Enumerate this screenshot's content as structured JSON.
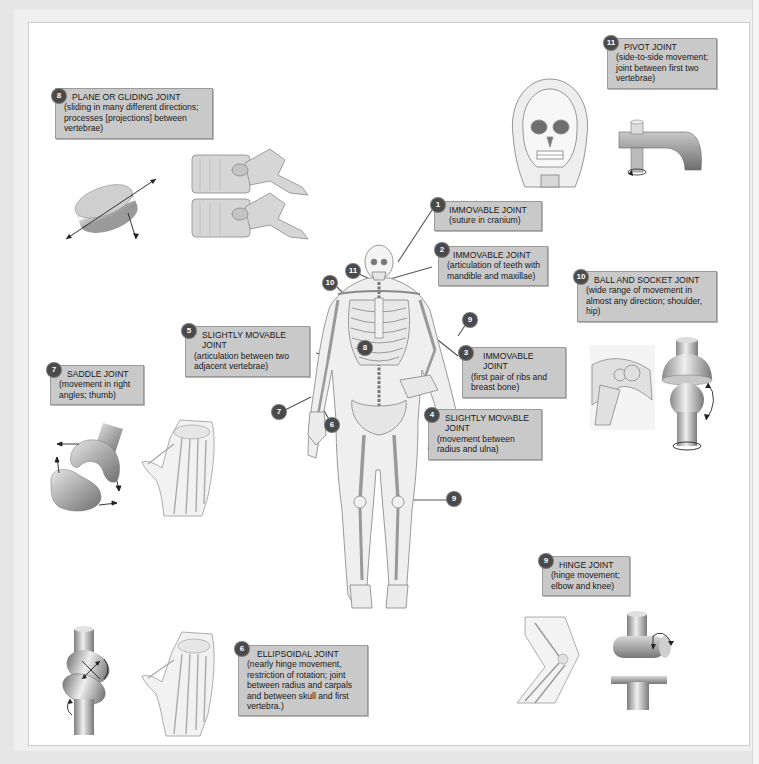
{
  "figure": {
    "colors": {
      "label_bg": "#c9c9c9",
      "label_border": "#9a9a9a",
      "badge_bg": "#4a4a4a",
      "badge_text": "#ffffff",
      "background": "#ffffff",
      "leader_line": "#555555"
    },
    "labels": [
      {
        "number": "1",
        "title": "IMMOVABLE JOINT",
        "description": "(suture in cranium)"
      },
      {
        "number": "2",
        "title": "IMMOVABLE JOINT",
        "description": "(articulation of teeth with mandible and maxillae)"
      },
      {
        "number": "3",
        "title": "IMMOVABLE JOINT",
        "description": "(first pair of ribs and breast bone)"
      },
      {
        "number": "4",
        "title": "SLIGHTLY MOVABLE JOINT",
        "description": "(movement between radius and ulna)"
      },
      {
        "number": "5",
        "title": "SLIGHTLY MOVABLE JOINT",
        "description": "(articulation between two adjacent vertebrae)"
      },
      {
        "number": "6",
        "title": "ELLIPSOIDAL JOINT",
        "description": "(nearly hinge movement, restriction of rotation; joint between radius and carpals and between skull and first vertebra.)"
      },
      {
        "number": "7",
        "title": "SADDLE JOINT",
        "description": "(movement in right angles;  thumb)"
      },
      {
        "number": "8",
        "title": "PLANE OR GLIDING JOINT",
        "description": "(sliding in many different directions;  processes [projections] between vertebrae)"
      },
      {
        "number": "9",
        "title": "HINGE JOINT",
        "description": "(hinge movement; elbow and knee)"
      },
      {
        "number": "10",
        "title": "BALL AND SOCKET JOINT",
        "description": "(wide range of movement in almost any direction; shoulder, hip)"
      },
      {
        "number": "11",
        "title": "PIVOT JOINT",
        "description": "(side-to-side movement; joint between first two vertebrae)"
      }
    ],
    "skeleton_markers": [
      {
        "number": "11",
        "location": "neck"
      },
      {
        "number": "10",
        "location": "shoulder"
      },
      {
        "number": "8",
        "location": "spine"
      },
      {
        "number": "9",
        "location": "elbow"
      },
      {
        "number": "7",
        "location": "thumb"
      },
      {
        "number": "6",
        "location": "wrist"
      },
      {
        "number": "9",
        "location": "knee"
      }
    ],
    "illustrations": [
      "plane-joint-model",
      "vertebrae-side-view",
      "skull-front-view",
      "pivot-joint-model",
      "shoulder-bones",
      "ball-socket-model",
      "saddle-joint-model",
      "hand-skeleton",
      "elbow-bones",
      "hinge-joint-model",
      "ellipsoidal-joint-model",
      "hand-wrist-skeleton",
      "full-body-skeleton"
    ]
  }
}
